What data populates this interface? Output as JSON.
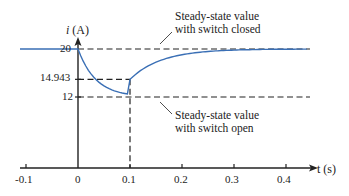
{
  "chart_data": {
    "type": "line",
    "title": "",
    "xlabel": "t (s)",
    "ylabel": "i (A)",
    "x_ticks": [
      "-0.1",
      "0",
      "0.1",
      "0.2",
      "0.3",
      "0.4"
    ],
    "y_ticks": [
      "20",
      "14.943",
      "12"
    ],
    "xlim": [
      -0.11,
      0.46
    ],
    "ylim": [
      0,
      21.5
    ],
    "grid": false,
    "series": [
      {
        "name": "i(t)",
        "color": "#3a6fb5",
        "x": [
          -0.11,
          0.0,
          0.02,
          0.04,
          0.06,
          0.08,
          0.1,
          0.12,
          0.15,
          0.2,
          0.25,
          0.3,
          0.35,
          0.4,
          0.45
        ],
        "values": [
          20,
          20,
          18.5,
          17.3,
          16.3,
          15.5,
          14.943,
          16.4,
          17.8,
          19.0,
          19.6,
          19.85,
          19.95,
          19.98,
          20
        ]
      }
    ],
    "reference_lines": [
      {
        "y": 20,
        "style": "dashed",
        "label": "Steady-state value with switch closed"
      },
      {
        "y": 14.943,
        "style": "dashed",
        "x_end": 0.1
      },
      {
        "y": 12,
        "style": "dashed",
        "label": "Steady-state value with switch open"
      },
      {
        "x": 0.1,
        "style": "dashed",
        "y_end": 14.943
      }
    ],
    "annotations": [
      {
        "text_line1": "Steady-state value",
        "text_line2": "with switch closed"
      },
      {
        "text_line1": "Steady-state value",
        "text_line2": "with switch open"
      }
    ]
  }
}
